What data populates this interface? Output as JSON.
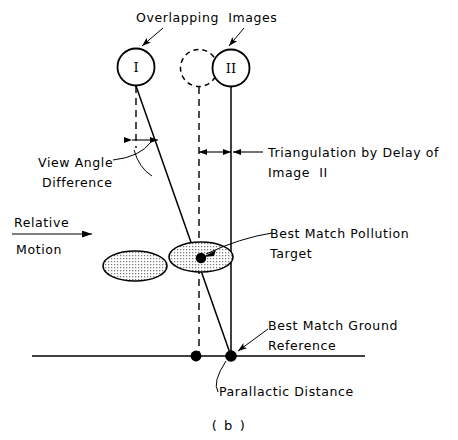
{
  "figure": {
    "caption": "( b )",
    "title_text": "Overlapping Images",
    "background_color": "#ffffff",
    "ink_color": "#000000"
  },
  "labels": {
    "overlapping_images": "Overlapping  Images",
    "view_angle_line1": "View Angle",
    "view_angle_line2": "Difference",
    "relative_line1": "Relative",
    "relative_line2": "Motion",
    "triangulation_line1": "Triangulation by Delay of",
    "triangulation_line2": "Image  II",
    "best_match_pollution_line1": "Best Match Pollution",
    "best_match_pollution_line2": "Target",
    "best_match_ground_line1": "Best Match Ground",
    "best_match_ground_line2": "Reference",
    "parallactic_distance": "Parallactic Distance"
  },
  "nodes": {
    "image_one_label": "I",
    "image_two_label": "II",
    "image_one": {
      "cx": 136,
      "cy": 67,
      "r": 18.5,
      "style": "solid"
    },
    "image_ghost": {
      "cx": 199,
      "cy": 68,
      "r": 18.5,
      "style": "dashed"
    },
    "image_two": {
      "cx": 231,
      "cy": 68,
      "r": 18.5,
      "style": "solid"
    }
  },
  "targets": {
    "pollution_ellipse_left": {
      "cx": 135,
      "cy": 266,
      "rx": 32,
      "ry": 15
    },
    "pollution_ellipse_right": {
      "cx": 201,
      "cy": 257,
      "rx": 32,
      "ry": 15
    },
    "best_match_point": {
      "cx": 201,
      "cy": 258
    },
    "ground_point_dashed": {
      "cx": 196,
      "cy": 356
    },
    "ground_point_solid": {
      "cx": 231,
      "cy": 356
    }
  },
  "geometry": {
    "ground_line": {
      "x1": 32,
      "y1": 356,
      "x2": 365,
      "y2": 356
    },
    "dashed_vertical": {
      "x": 199,
      "y1": 87,
      "y2": 356
    },
    "solid_vertical": {
      "x": 231,
      "y1": 87,
      "y2": 356
    },
    "short_dashed_vertical": {
      "x": 136,
      "y1": 86,
      "y2": 148
    },
    "sight_line": {
      "x1": 136,
      "y1": 86,
      "x2": 231,
      "y2": 356
    },
    "relative_motion_arrow": {
      "x1": 14,
      "y1": 232,
      "x2": 92,
      "y2": 232
    }
  },
  "icons": {
    "leader_arrow": "arrowhead-icon",
    "motion_arrow": "right-arrow-icon",
    "angle_arc": "arc-icon",
    "dimension_arrow_left": "left-dimension-arrow-icon",
    "dimension_arrow_right": "right-dimension-arrow-icon"
  }
}
